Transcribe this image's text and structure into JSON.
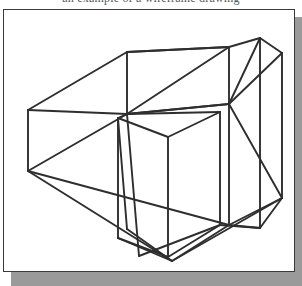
{
  "page": {
    "width": 302,
    "height": 286,
    "background_color": "#ffffff"
  },
  "caption": {
    "text": "an example of a wireframe drawing",
    "note": "clipped at top of image; only letter descenders visible"
  },
  "figure": {
    "frame": {
      "border_color": "#3a3a3a",
      "fill_color": "#ffffff",
      "shadow_color": "#9a9a9a"
    },
    "line_color": "#2e2e2e",
    "line_width": 1.9,
    "paths": [
      "M 24 100 L 123 42 L 225 37 L 225 37",
      "M 24 100 L 24 161",
      "M 123 42 L 123 104",
      "M 24 100 L 123 104 L 225 94",
      "M 225 37 L 225 94",
      "M 123 42 L 225 37",
      "M 24 161 L 123 104",
      "M 24 161 L 168 251",
      "M 123 104 L 225 94",
      "M 225 37 L 123 104",
      "M 114 108 L 123 104",
      "M 114 108 L 114 228",
      "M 114 108 L 164 127 L 216 102",
      "M 164 127 L 164 247",
      "M 216 102 L 216 215",
      "M 114 228 L 164 247 L 216 215",
      "M 123 104 L 216 102",
      "M 114 108 L 123 219",
      "M 123 104 L 135 246",
      "M 225 37 L 256 28 L 256 28",
      "M 256 28 L 278 43",
      "M 256 28 L 256 218",
      "M 278 43 L 278 188",
      "M 225 94 L 256 28",
      "M 225 94 L 278 43",
      "M 225 94 L 225 215",
      "M 225 94 L 278 188",
      "M 225 215 L 256 218 L 278 188",
      "M 168 251 L 225 215",
      "M 168 251 L 278 188",
      "M 24 161 L 225 215",
      "M 168 251 L 114 228",
      "M 123 219 L 168 251",
      "M 135 246 L 216 215",
      "M 216 215 L 256 218",
      "M 225 215 L 278 188"
    ]
  }
}
